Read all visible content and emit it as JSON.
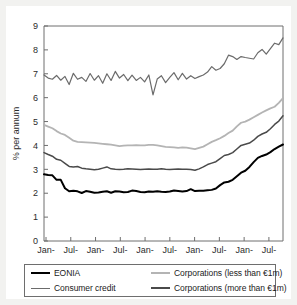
{
  "chart_data": {
    "type": "line",
    "title": "",
    "xlabel": "",
    "ylabel": "% per annum",
    "ylim": [
      0,
      9
    ],
    "yticks": [
      0,
      1,
      2,
      3,
      4,
      5,
      6,
      7,
      8,
      9
    ],
    "ytick_labels": [
      "0",
      "1",
      "2",
      "3",
      "4",
      "5",
      "6",
      "7",
      "8",
      "9"
    ],
    "xtick_labels": [
      "Jan-\n03",
      "Jul-\n03",
      "Jan-\n04",
      "Jul-\n04",
      "Jan-\n05",
      "Jul-\n05",
      "Jan-\n06",
      "Jul-\n06",
      "Jan-\n07",
      "Jul-\n07"
    ],
    "xtick_lines": [
      [
        "Jan-",
        "03"
      ],
      [
        "Jul-",
        "03"
      ],
      [
        "Jan-",
        "04"
      ],
      [
        "Jul-",
        "04"
      ],
      [
        "Jan-",
        "05"
      ],
      [
        "Jul-",
        "05"
      ],
      [
        "Jan-",
        "06"
      ],
      [
        "Jul-",
        "06"
      ],
      [
        "Jan-",
        "07"
      ],
      [
        "Jul-",
        "07"
      ]
    ],
    "grid": false,
    "legend_position": "below",
    "x_start": "Jan-03",
    "x_end": "Oct-07",
    "x_count": 58,
    "series": [
      {
        "name": "EONIA",
        "color": "#000000",
        "width": 2.0,
        "values": [
          2.79,
          2.76,
          2.75,
          2.56,
          2.56,
          2.21,
          2.08,
          2.1,
          2.08,
          2.01,
          2.09,
          2.06,
          2.02,
          2.03,
          2.06,
          2.08,
          2.02,
          2.08,
          2.07,
          2.04,
          2.05,
          2.11,
          2.09,
          2.05,
          2.04,
          2.07,
          2.06,
          2.08,
          2.06,
          2.05,
          2.07,
          2.11,
          2.09,
          2.07,
          2.09,
          2.17,
          2.09,
          2.1,
          2.1,
          2.12,
          2.14,
          2.2,
          2.34,
          2.45,
          2.48,
          2.56,
          2.71,
          2.86,
          2.94,
          3.1,
          3.3,
          3.48,
          3.56,
          3.62,
          3.72,
          3.85,
          3.95,
          4.04
        ]
      },
      {
        "name": "Consumer credit",
        "color": "#6b6b6b",
        "width": 1.2,
        "values": [
          6.95,
          6.82,
          6.77,
          6.93,
          6.73,
          6.89,
          6.55,
          7.02,
          6.77,
          6.85,
          6.68,
          7.01,
          6.73,
          6.92,
          6.6,
          7.0,
          6.72,
          7.1,
          6.82,
          6.97,
          6.71,
          6.94,
          6.72,
          6.85,
          6.66,
          6.95,
          6.12,
          6.78,
          6.92,
          6.63,
          6.85,
          7.05,
          6.75,
          7.02,
          6.78,
          6.92,
          6.8,
          6.88,
          6.95,
          7.07,
          7.3,
          7.15,
          7.22,
          7.42,
          7.78,
          7.72,
          7.6,
          7.72,
          7.68,
          7.65,
          7.62,
          7.88,
          8.02,
          7.82,
          8.05,
          8.28,
          8.22,
          8.5
        ]
      },
      {
        "name": "Corporations (less than €1m)",
        "color": "#b4b4b4",
        "width": 1.8,
        "values": [
          4.86,
          4.79,
          4.72,
          4.6,
          4.5,
          4.44,
          4.32,
          4.2,
          4.15,
          4.14,
          4.13,
          4.12,
          4.11,
          4.09,
          4.07,
          4.05,
          4.03,
          4.0,
          3.97,
          3.99,
          4.0,
          4.0,
          4.01,
          4.0,
          4.0,
          4.02,
          4.02,
          4.0,
          3.97,
          3.94,
          3.93,
          3.92,
          3.9,
          3.92,
          3.91,
          3.88,
          3.85,
          3.9,
          3.95,
          4.05,
          4.15,
          4.22,
          4.3,
          4.4,
          4.52,
          4.62,
          4.8,
          4.95,
          5.0,
          5.08,
          5.18,
          5.28,
          5.38,
          5.47,
          5.55,
          5.62,
          5.78,
          5.98
        ]
      },
      {
        "name": "Corporations (more than €1m)",
        "color": "#4a4a4a",
        "width": 1.5,
        "values": [
          3.7,
          3.62,
          3.55,
          3.42,
          3.38,
          3.25,
          3.12,
          3.1,
          3.12,
          3.05,
          3.02,
          3.0,
          2.98,
          3.0,
          3.05,
          3.1,
          3.02,
          3.0,
          2.99,
          3.0,
          3.02,
          3.01,
          3.0,
          2.99,
          3.0,
          3.01,
          3.0,
          3.0,
          3.02,
          3.0,
          2.99,
          3.0,
          3.01,
          3.0,
          3.0,
          2.99,
          2.96,
          3.02,
          3.1,
          3.2,
          3.26,
          3.32,
          3.45,
          3.58,
          3.62,
          3.7,
          3.85,
          4.0,
          4.05,
          4.1,
          4.22,
          4.38,
          4.48,
          4.55,
          4.7,
          4.88,
          5.02,
          5.24
        ]
      }
    ]
  },
  "legend": {
    "entries": [
      {
        "label": "EONIA",
        "color": "#000000",
        "width": 2.6
      },
      {
        "label": "Consumer credit",
        "color": "#6b6b6b",
        "width": 1.8
      },
      {
        "label": "Corporations (less than €1m)",
        "color": "#b4b4b4",
        "width": 2.4
      },
      {
        "label": "Corporations (more than €1m)",
        "color": "#4a4a4a",
        "width": 2.2
      }
    ]
  },
  "style": {
    "axis_color": "#6e6e6e",
    "card_background": "#ffffff",
    "page_background": "#f2f2f0",
    "text_color": "#2b2b2b"
  }
}
